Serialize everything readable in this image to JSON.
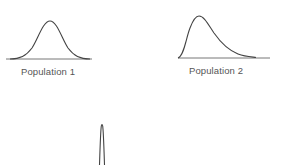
{
  "diagram": {
    "panels": [
      {
        "id": "population-1",
        "label": "Population 1",
        "shape": "symmetric bell-shaped (normal) distribution"
      },
      {
        "id": "population-2",
        "label": "Population 2",
        "shape": "right-skewed distribution with long right tail"
      },
      {
        "id": "sampling-distribution",
        "label": "",
        "shape": "very narrow tall peak (partially visible, cut off at bottom)"
      }
    ],
    "colors": {
      "curve": "#444444",
      "baseline": "#666666",
      "text": "#555555",
      "background": "#ffffff"
    }
  }
}
